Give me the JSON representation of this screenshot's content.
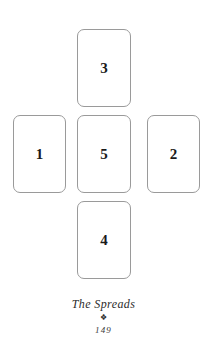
{
  "page": {
    "background_color": "#ffffff",
    "card_border_color": "#9a9a9a",
    "text_color": "#2b2b2b"
  },
  "spread": {
    "name": "celtic-cross-five-card-spread",
    "cards": [
      {
        "position": "left",
        "label": "1"
      },
      {
        "position": "right",
        "label": "2"
      },
      {
        "position": "top",
        "label": "3"
      },
      {
        "position": "bottom",
        "label": "4"
      },
      {
        "position": "center",
        "label": "5"
      }
    ]
  },
  "footer": {
    "title": "The Spreads",
    "ornament": "❖",
    "page_number": "149"
  }
}
